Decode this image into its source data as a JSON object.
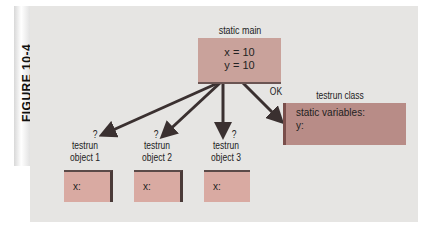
{
  "figure": {
    "label": "FIGURE 10-4"
  },
  "static_main": {
    "title": "static main",
    "lines": [
      "x = 10",
      "y = 10"
    ],
    "color": "#c9a29b"
  },
  "testrun_class": {
    "title": "testrun class",
    "lines": [
      "static variables:",
      "y:"
    ],
    "color": "#b88c87"
  },
  "arrow_labels": {
    "ok": "OK"
  },
  "objects": [
    {
      "question": "?",
      "title_line1": "testrun",
      "title_line2": "object 1",
      "field": "x:"
    },
    {
      "question": "?",
      "title_line1": "testrun",
      "title_line2": "object 2",
      "field": "x:"
    },
    {
      "question": "?",
      "title_line1": "testrun",
      "title_line2": "object 3",
      "field": "x:"
    }
  ],
  "colors": {
    "panel": "#e6e5e3",
    "arrow": "#3a3030",
    "object": "#d9aaa2"
  }
}
